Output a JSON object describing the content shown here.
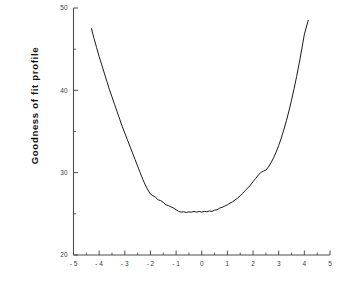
{
  "chart_data": {
    "type": "line",
    "title": "",
    "xlabel": "",
    "ylabel": "Goodness of fit profile",
    "xlim": [
      -5,
      5
    ],
    "ylim": [
      20,
      50
    ],
    "grid": false,
    "legend": null,
    "line_color": "#1a1a1a",
    "background_color": "#ffffff",
    "axis_color": "#4d4d4d",
    "xticks": [
      -5,
      -4,
      -3,
      -2,
      -1,
      0,
      1,
      2,
      3,
      4,
      5
    ],
    "xtick_labels": [
      "- 5",
      "- 4",
      "- 3",
      "- 2",
      "- 1",
      "0",
      "1",
      "2",
      "3",
      "4",
      "5"
    ],
    "xminor_ticks": [
      -4.5,
      -3.5,
      -2.5,
      -1.5,
      -0.5,
      0.5,
      1.5,
      2.5,
      3.5,
      4.5
    ],
    "yticks": [
      20,
      30,
      40,
      50
    ],
    "ytick_labels": [
      "20",
      "30",
      "40",
      "50"
    ],
    "yminor_ticks": [
      25,
      35,
      45
    ],
    "series": [
      {
        "name": "goodness-of-fit profile",
        "x": [
          -4.3,
          -4.2,
          -4.1,
          -4.0,
          -3.9,
          -3.8,
          -3.7,
          -3.6,
          -3.5,
          -3.4,
          -3.3,
          -3.2,
          -3.1,
          -3.0,
          -2.9,
          -2.8,
          -2.7,
          -2.6,
          -2.5,
          -2.4,
          -2.3,
          -2.2,
          -2.1,
          -2.0,
          -1.9,
          -1.8,
          -1.7,
          -1.6,
          -1.5,
          -1.4,
          -1.3,
          -1.2,
          -1.1,
          -1.0,
          -0.9,
          -0.8,
          -0.7,
          -0.6,
          -0.5,
          -0.4,
          -0.3,
          -0.2,
          -0.1,
          0.0,
          0.1,
          0.2,
          0.3,
          0.4,
          0.5,
          0.6,
          0.7,
          0.8,
          0.9,
          1.0,
          1.1,
          1.2,
          1.3,
          1.4,
          1.5,
          1.6,
          1.7,
          1.8,
          1.9,
          2.0,
          2.1,
          2.2,
          2.3,
          2.4,
          2.5,
          2.6,
          2.7,
          2.8,
          2.9,
          3.0,
          3.1,
          3.2,
          3.3,
          3.4,
          3.5,
          3.6,
          3.7,
          3.8,
          3.9,
          4.0,
          4.15
        ],
        "y": [
          47.5,
          46.3,
          45.2,
          44.1,
          43.1,
          42.1,
          41.1,
          40.1,
          39.2,
          38.3,
          37.4,
          36.5,
          35.6,
          34.8,
          34.0,
          33.2,
          32.4,
          31.6,
          30.8,
          30.0,
          29.2,
          28.5,
          27.9,
          27.4,
          27.2,
          27.0,
          26.7,
          26.6,
          26.4,
          26.1,
          26.0,
          25.85,
          25.7,
          25.5,
          25.3,
          25.2,
          25.25,
          25.15,
          25.25,
          25.2,
          25.3,
          25.2,
          25.3,
          25.2,
          25.3,
          25.25,
          25.35,
          25.3,
          25.45,
          25.5,
          25.7,
          25.8,
          25.95,
          26.1,
          26.3,
          26.45,
          26.7,
          26.9,
          27.2,
          27.5,
          27.85,
          28.15,
          28.5,
          28.9,
          29.3,
          29.7,
          30.0,
          30.2,
          30.3,
          30.7,
          31.2,
          31.8,
          32.5,
          33.3,
          34.2,
          35.2,
          36.3,
          37.5,
          38.8,
          40.2,
          41.7,
          43.3,
          45.0,
          46.8,
          48.5
        ]
      }
    ]
  }
}
